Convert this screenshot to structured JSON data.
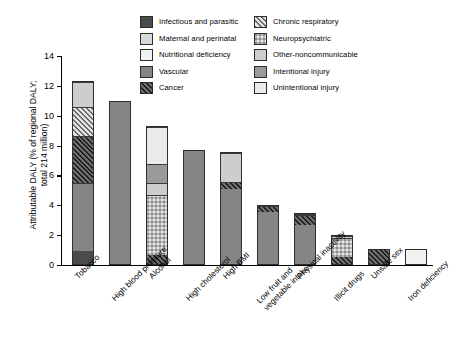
{
  "chart_data": {
    "type": "bar",
    "title": "",
    "subtitle": "",
    "xlabel": "",
    "ylabel": "Attributable DALY (% of regional DALY; total 214 million)",
    "ylabel_line1": "Attributable DALY (% of regional DALY;",
    "ylabel_line2": "total 214 million)",
    "ylim": [
      0,
      14
    ],
    "ytick_values": [
      0,
      2,
      4,
      6,
      8,
      10,
      12,
      14
    ],
    "ytick_labels": [
      "0",
      "2",
      "4",
      "6",
      "8",
      "10",
      "12",
      "14"
    ],
    "grid": false,
    "legend_position": "top",
    "stacked": true,
    "categories": [
      "Tobacco",
      "High blood pressure",
      "Alcohol",
      "High cholesterol",
      "High BMI",
      "Low fruit and vegetable intake",
      "Physical inactivity",
      "Illicit drugs",
      "Unsafe sex",
      "Iron deficiency"
    ],
    "category_labels": [
      {
        "line1": "Tobacco",
        "line2": ""
      },
      {
        "line1": "High blood pressure",
        "line2": ""
      },
      {
        "line1": "Alcohol",
        "line2": ""
      },
      {
        "line1": "High cholesterol",
        "line2": ""
      },
      {
        "line1": "High BMI",
        "line2": ""
      },
      {
        "line1": "Low fruit and",
        "line2": "vegetable intake"
      },
      {
        "line1": "Physical inactivity",
        "line2": ""
      },
      {
        "line1": "Illicit drugs",
        "line2": ""
      },
      {
        "line1": "Unsafe sex",
        "line2": ""
      },
      {
        "line1": "Iron deficiency",
        "line2": ""
      }
    ],
    "totals": [
      12.3,
      11.0,
      9.3,
      7.7,
      7.6,
      4.0,
      3.5,
      2.0,
      1.1,
      1.05
    ],
    "series": [
      {
        "name": "Infectious and parasitic",
        "key": "infectious",
        "values": [
          0.9,
          0,
          0,
          0,
          0,
          0,
          0,
          0,
          0,
          0
        ]
      },
      {
        "name": "Maternal and perinatal",
        "key": "maternal",
        "values": [
          0,
          0,
          0,
          0,
          0,
          0,
          0,
          0,
          0,
          0
        ]
      },
      {
        "name": "Nutritional deficiency",
        "key": "nutritional",
        "values": [
          0,
          0,
          0,
          0,
          0,
          0,
          0,
          0,
          0,
          1.05
        ]
      },
      {
        "name": "Vascular",
        "key": "vascular",
        "values": [
          4.6,
          11.0,
          0,
          7.7,
          5.1,
          3.6,
          2.7,
          0,
          0,
          0
        ]
      },
      {
        "name": "Cancer",
        "key": "cancer",
        "values": [
          3.2,
          0,
          0.6,
          0,
          0.5,
          0.4,
          0.7,
          0.5,
          1.1,
          0
        ]
      },
      {
        "name": "Chronic respiratory",
        "key": "chronicresp",
        "values": [
          1.9,
          0,
          0,
          0,
          0,
          0,
          0,
          0,
          0,
          0
        ]
      },
      {
        "name": "Neuropsychiatric",
        "key": "neuro",
        "values": [
          0,
          0,
          4.1,
          0,
          0,
          0,
          0,
          1.35,
          0,
          0
        ]
      },
      {
        "name": "Other-noncommunicable",
        "key": "othernon",
        "values": [
          1.7,
          0,
          0.8,
          0,
          2.0,
          0,
          0.1,
          0.15,
          0,
          0
        ]
      },
      {
        "name": "Intentional injury",
        "key": "intentional",
        "values": [
          0,
          0,
          1.3,
          0,
          0,
          0,
          0,
          0,
          0,
          0
        ]
      },
      {
        "name": "Unintentional injury",
        "key": "unintentional",
        "values": [
          0,
          0,
          2.5,
          0,
          0,
          0,
          0,
          0,
          0,
          0
        ]
      }
    ]
  },
  "legend": {
    "column_left": [
      {
        "label": "Infectious and parasitic",
        "key": "infectious"
      },
      {
        "label": "Maternal and perinatal",
        "key": "maternal"
      },
      {
        "label": "Nutritional deficiency",
        "key": "nutritional"
      },
      {
        "label": "Vascular",
        "key": "vascular"
      },
      {
        "label": "Cancer",
        "key": "cancer"
      }
    ],
    "column_right": [
      {
        "label": "Chronic respiratory",
        "key": "chronicresp"
      },
      {
        "label": "Neuropsychiatric",
        "key": "neuro"
      },
      {
        "label": "Other-noncommunicable",
        "key": "othernon"
      },
      {
        "label": "Intentional injury",
        "key": "intentional"
      },
      {
        "label": "Unintentional injury",
        "key": "unintentional"
      }
    ]
  },
  "colors": {
    "infectious": "#4b4b4b",
    "maternal": "#d9d9d9",
    "nutritional": "#f2f2f2",
    "vascular": "#858585",
    "cancer": "#6d6d6d",
    "chronicresp": "#e2e2e2",
    "neuro": "#e8e8e8",
    "othernon": "#cdcdcd",
    "intentional": "#9a9a9a",
    "unintentional": "#ebebeb",
    "axis": "#000000",
    "background": "#ffffff"
  }
}
